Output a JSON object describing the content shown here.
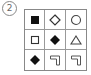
{
  "label": "2",
  "grid": {
    "rows": 3,
    "cols": 3,
    "cells": [
      {
        "shape": "square",
        "fill": "filled"
      },
      {
        "shape": "diamond",
        "fill": "outline"
      },
      {
        "shape": "circle",
        "fill": "outline"
      },
      {
        "shape": "square",
        "fill": "outline"
      },
      {
        "shape": "diamond",
        "fill": "filled"
      },
      {
        "shape": "triangle",
        "fill": "outline"
      },
      {
        "shape": "diamond",
        "fill": "filled"
      },
      {
        "shape": "corner-bracket",
        "fill": "outline"
      },
      {
        "shape": "corner-bracket",
        "fill": "outline"
      }
    ]
  },
  "colors": {
    "ink": "#111111",
    "outline": "#555555",
    "grid": "#888888"
  }
}
